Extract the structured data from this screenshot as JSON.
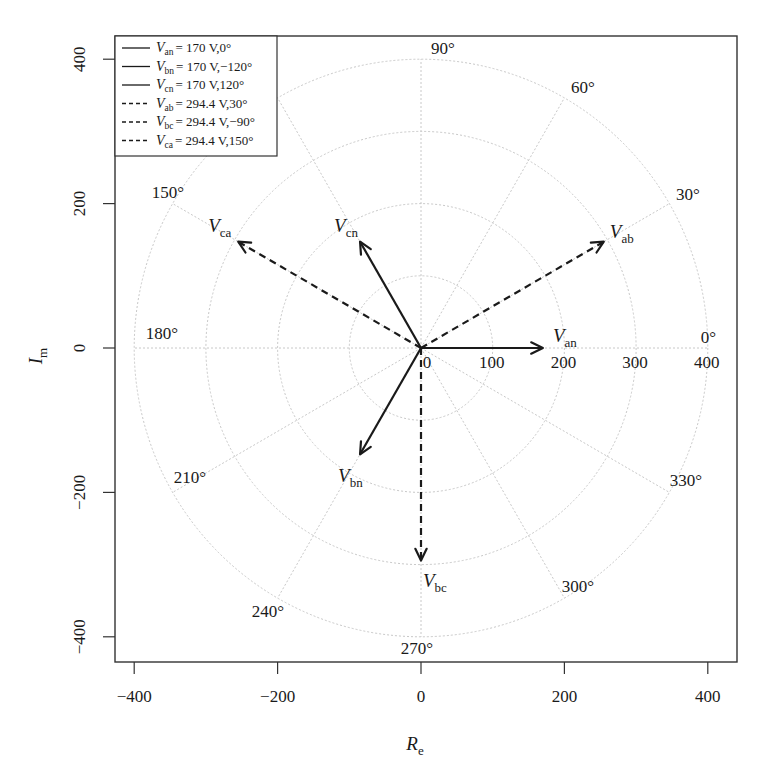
{
  "chart_data": {
    "type": "polar-phasor",
    "title": "",
    "xlabel": "R_e",
    "ylabel": "I_m",
    "xlabel_main": "R",
    "xlabel_sub": "e",
    "ylabel_main": "I",
    "ylabel_sub": "m",
    "xlim": [
      -430,
      430
    ],
    "ylim": [
      -440,
      440
    ],
    "x_ticks": [
      -400,
      -200,
      0,
      200,
      400
    ],
    "y_ticks": [
      -400,
      -200,
      0,
      200,
      400
    ],
    "x_tick_labels": [
      "−400",
      "−200",
      "0",
      "200",
      "400"
    ],
    "y_tick_labels": [
      "−400",
      "−200",
      "0",
      "200",
      "400"
    ],
    "radial_grid": [
      100,
      200,
      300,
      400
    ],
    "radial_labels": [
      "0",
      "100",
      "200",
      "300",
      "400"
    ],
    "radial_label_values": [
      0,
      100,
      200,
      300,
      400
    ],
    "angle_grid_deg": [
      0,
      30,
      60,
      90,
      120,
      150,
      180,
      210,
      240,
      270,
      300,
      330
    ],
    "angle_labels": [
      "0°",
      "30°",
      "60°",
      "90°",
      "150°",
      "180°",
      "210°",
      "240°",
      "270°",
      "300°",
      "330°"
    ],
    "grid": true,
    "legend_position": "top-left",
    "series": [
      {
        "name": "V_an",
        "main": "V",
        "sub": "an",
        "magnitude": 170,
        "angle_deg": 0,
        "style": "solid",
        "legend": "= 170 V,0°"
      },
      {
        "name": "V_bn",
        "main": "V",
        "sub": "bn",
        "magnitude": 170,
        "angle_deg": -120,
        "style": "solid",
        "legend": "= 170 V,−120°"
      },
      {
        "name": "V_cn",
        "main": "V",
        "sub": "cn",
        "magnitude": 170,
        "angle_deg": 120,
        "style": "solid",
        "legend": "= 170 V,120°"
      },
      {
        "name": "V_ab",
        "main": "V",
        "sub": "ab",
        "magnitude": 294.4,
        "angle_deg": 30,
        "style": "dashed",
        "legend": "= 294.4 V,30°"
      },
      {
        "name": "V_bc",
        "main": "V",
        "sub": "bc",
        "magnitude": 294.4,
        "angle_deg": -90,
        "style": "dashed",
        "legend": "= 294.4 V,−90°"
      },
      {
        "name": "V_ca",
        "main": "V",
        "sub": "ca",
        "magnitude": 294.4,
        "angle_deg": 150,
        "style": "dashed",
        "legend": "= 294.4 V,150°"
      }
    ]
  },
  "layout": {
    "origin_px": [
      421,
      348
    ],
    "scale_x": 0.717,
    "scale_y": 0.722,
    "frame": {
      "left": 115,
      "top": 36,
      "right": 737,
      "bottom": 662
    }
  }
}
